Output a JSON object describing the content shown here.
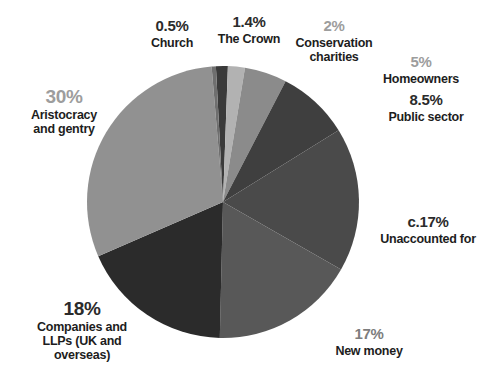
{
  "chart_data": {
    "type": "pie",
    "title": "",
    "subtitle": "",
    "xlabel": "",
    "ylabel": "",
    "legend_position": "none",
    "grid": false,
    "total": 100,
    "start_angle_deg": -3,
    "direction": "clockwise",
    "categories": [
      "The Crown",
      "Conservation charities",
      "Homeowners",
      "Public sector",
      "Unaccounted for",
      "New money",
      "Companies and LLPs (UK and overseas)",
      "Aristocracy and gentry",
      "Church"
    ],
    "values": [
      1.4,
      2,
      5,
      8.5,
      17,
      17,
      18,
      30,
      0.5
    ],
    "value_labels": [
      "1.4%",
      "2%",
      "5%",
      "8.5%",
      "c.17%",
      "17%",
      "18%",
      "30%",
      "0.5%"
    ],
    "colors": [
      "#3a3a3a",
      "#b2b2b2",
      "#8b8b8b",
      "#3f3f3f",
      "#4a4a4a",
      "#585858",
      "#2b2b2b",
      "#919191",
      "#6f6f6f"
    ],
    "slices": [
      {
        "label": "The Crown",
        "value": 1.4,
        "value_label": "1.4%",
        "color": "#3a3a3a"
      },
      {
        "label": "Conservation charities",
        "value": 2,
        "value_label": "2%",
        "color": "#b2b2b2"
      },
      {
        "label": "Homeowners",
        "value": 5,
        "value_label": "5%",
        "color": "#8b8b8b"
      },
      {
        "label": "Public sector",
        "value": 8.5,
        "value_label": "8.5%",
        "color": "#3f3f3f"
      },
      {
        "label": "Unaccounted for",
        "value": 17,
        "value_label": "c.17%",
        "color": "#4a4a4a"
      },
      {
        "label": "New money",
        "value": 17,
        "value_label": "17%",
        "color": "#585858"
      },
      {
        "label": "Companies and LLPs (UK and overseas)",
        "value": 18,
        "value_label": "18%",
        "color": "#2b2b2b"
      },
      {
        "label": "Aristocracy and gentry",
        "value": 30,
        "value_label": "30%",
        "color": "#919191"
      },
      {
        "label": "Church",
        "value": 0.5,
        "value_label": "0.5%",
        "color": "#6f6f6f"
      }
    ]
  },
  "labels": {
    "church": {
      "pct": "0.5%",
      "line1": "Church"
    },
    "crown": {
      "pct": "1.4%",
      "line1": "The Crown"
    },
    "conservation": {
      "pct": "2%",
      "line1": "Conservation",
      "line2": "charities"
    },
    "homeowners": {
      "pct": "5%",
      "line1": "Homeowners"
    },
    "public": {
      "pct": "8.5%",
      "line1": "Public sector"
    },
    "unaccounted": {
      "pct": "c.17%",
      "line1": "Unaccounted for"
    },
    "newmoney": {
      "pct": "17%",
      "line1": "New money"
    },
    "companies": {
      "pct": "18%",
      "line1": "Companies and",
      "line2": "LLPs (UK and",
      "line3": "overseas)"
    },
    "aristocracy": {
      "pct": "30%",
      "line1": "Aristocracy",
      "line2": "and gentry"
    }
  },
  "colors": {
    "background": "#ffffff",
    "text_dark": "#1d1d1d",
    "text_light": "#9d9d9d"
  }
}
